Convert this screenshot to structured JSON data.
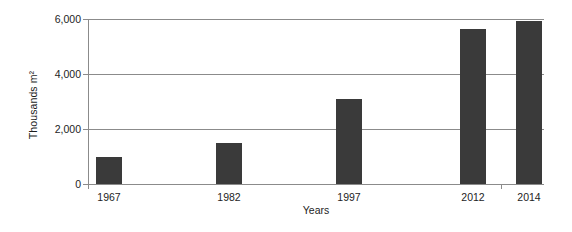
{
  "chart_data": {
    "type": "bar",
    "title": "",
    "subtitle": "",
    "xlabel": "Years",
    "ylabel": "Thousands m²",
    "categories": [
      "1967",
      "1982",
      "1997",
      "2012",
      "2014"
    ],
    "values": [
      1000,
      1500,
      3100,
      5640,
      5930
    ],
    "series": [
      {
        "name": "",
        "values": [
          1000,
          1500,
          3100,
          5640,
          5930
        ]
      }
    ],
    "ylim": [
      0,
      6000
    ],
    "yticks": [
      0,
      2000,
      4000,
      6000
    ],
    "ytick_labels": [
      "0",
      "2,000",
      "4,000",
      "6,000"
    ],
    "grid": true,
    "grid_axis": "y",
    "legend": false,
    "legend_position": "none",
    "bar_color": "#3a3a3a",
    "axis_color": "#8b8b8b",
    "background_color": "#ffffff",
    "annotations": []
  }
}
